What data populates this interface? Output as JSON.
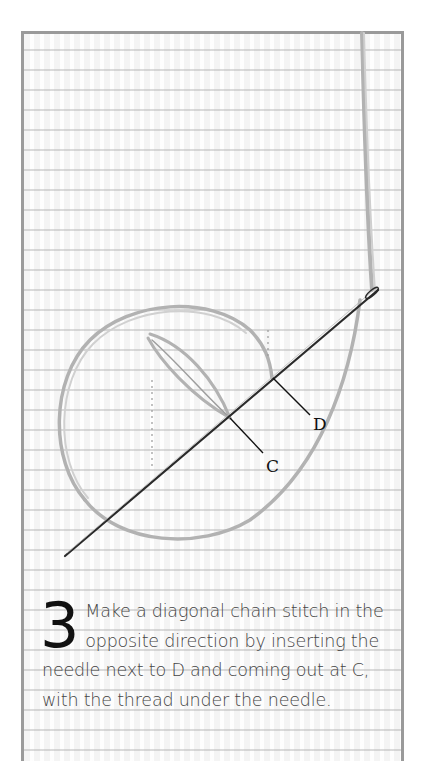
{
  "step": {
    "number": "3",
    "text": "Make a diagonal chain stitch in the opposite direction by inserting the needle next to D and coming out at C, with the thread under the needle."
  },
  "labels": {
    "point_d": "D",
    "point_c": "C"
  },
  "colors": {
    "frame_border": "#9a9a9a",
    "fabric": "#f4f4f4",
    "thread": "#b5b5b5",
    "needle": "#2a2a2a",
    "text": "#444444"
  }
}
